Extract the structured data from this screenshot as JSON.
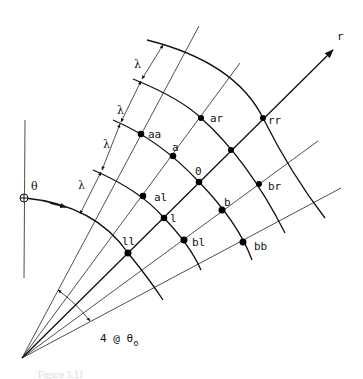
{
  "figure": {
    "axis_label": "r",
    "angle_label": "θ",
    "spacing_label": "λ",
    "angular_dimension_label": "4 @ θ",
    "angular_dimension_subscript": "o",
    "caption": "Figure 3.11"
  },
  "nodes": [
    {
      "id": "aa",
      "label": "aa",
      "x": 141,
      "y": 134
    },
    {
      "id": "ar",
      "label": "ar",
      "x": 201,
      "y": 118
    },
    {
      "id": "rr",
      "label": "rr",
      "x": 263,
      "y": 118
    },
    {
      "id": "a",
      "label": "a",
      "x": 173,
      "y": 156
    },
    {
      "id": "0",
      "label": "0",
      "x": 199,
      "y": 182
    },
    {
      "id": "ur",
      "label": "",
      "x": 231,
      "y": 150
    },
    {
      "id": "al",
      "label": "al",
      "x": 143,
      "y": 196
    },
    {
      "id": "l",
      "label": "l",
      "x": 164,
      "y": 218
    },
    {
      "id": "b",
      "label": "b",
      "x": 222,
      "y": 210
    },
    {
      "id": "br",
      "label": "br",
      "x": 259,
      "y": 184
    },
    {
      "id": "ll",
      "label": "ll",
      "x": 128,
      "y": 253
    },
    {
      "id": "bl",
      "label": "bl",
      "x": 184,
      "y": 240
    },
    {
      "id": "bb",
      "label": "bb",
      "x": 243,
      "y": 242
    }
  ],
  "colors": {
    "ink": "#111111",
    "background": "#ffffff"
  }
}
